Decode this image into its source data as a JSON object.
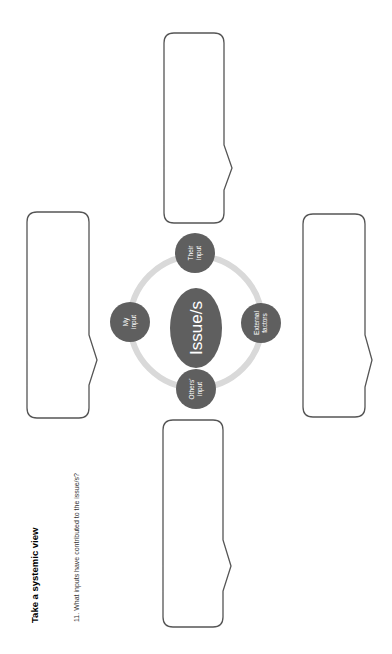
{
  "page": {
    "title": "Take a systemic view",
    "question_number": "11.",
    "question_text": "What inputs have contributed to the issue/s?"
  },
  "diagram": {
    "center": {
      "label": "Issue/s"
    },
    "nodes": [
      {
        "id": "their-input",
        "line1": "Their",
        "line2": "input"
      },
      {
        "id": "my-input",
        "line1": "My",
        "line2": "input"
      },
      {
        "id": "external-factors",
        "line1": "External",
        "line2": "factors"
      },
      {
        "id": "others-input",
        "line1": "Others'",
        "line2": "input"
      }
    ],
    "colors": {
      "node_fill": "#5f5f5f",
      "ring": "#d9d9d9",
      "box_stroke": "#555555",
      "label": "#ffffff"
    }
  },
  "answer_boxes": [
    {
      "id": "box-their-input",
      "value": ""
    },
    {
      "id": "box-my-input",
      "value": ""
    },
    {
      "id": "box-external-factors",
      "value": ""
    },
    {
      "id": "box-others-input",
      "value": ""
    }
  ]
}
